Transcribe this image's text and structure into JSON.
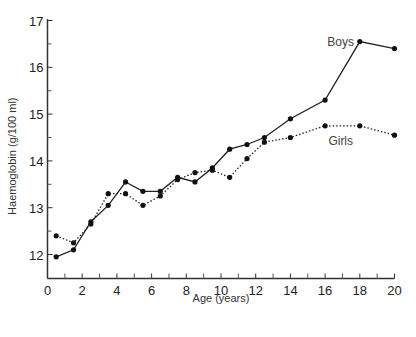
{
  "chart_data": {
    "type": "line",
    "title": "",
    "xlabel": "Age (years)",
    "ylabel": "Haemoglobin (g/100 ml)",
    "xlim": [
      0,
      20
    ],
    "ylim": [
      11.5,
      17
    ],
    "x_ticks": [
      0,
      2,
      4,
      6,
      8,
      10,
      12,
      14,
      16,
      18,
      20
    ],
    "x_minor_ticks": [
      1,
      3,
      5,
      7,
      9,
      11,
      13,
      15,
      17,
      19
    ],
    "y_ticks": [
      12,
      13,
      14,
      15,
      16,
      17
    ],
    "y_minor_ticks": [
      12.5,
      13.5,
      14.5,
      15.5,
      16.5
    ],
    "grid": false,
    "legend": "inline labels at line ends (top-right)",
    "series": [
      {
        "name": "Boys",
        "line_style": "solid",
        "x": [
          0.5,
          1.5,
          2.5,
          3.5,
          4.5,
          5.5,
          6.5,
          7.5,
          8.5,
          9.5,
          10.5,
          11.5,
          12.5,
          14,
          16,
          18,
          20
        ],
        "values": [
          11.95,
          12.1,
          12.7,
          13.05,
          13.55,
          13.35,
          13.35,
          13.65,
          13.55,
          13.85,
          14.25,
          14.35,
          14.5,
          14.9,
          15.3,
          16.55,
          16.4
        ]
      },
      {
        "name": "Girls",
        "line_style": "dotted",
        "x": [
          0.5,
          1.5,
          2.5,
          3.5,
          4.5,
          5.5,
          6.5,
          7.5,
          8.5,
          9.5,
          10.5,
          11.5,
          12.5,
          14,
          16,
          18,
          20
        ],
        "values": [
          12.4,
          12.25,
          12.65,
          13.3,
          13.3,
          13.05,
          13.25,
          13.6,
          13.75,
          13.8,
          13.65,
          14.05,
          14.4,
          14.5,
          14.75,
          14.75,
          14.55
        ]
      }
    ]
  }
}
